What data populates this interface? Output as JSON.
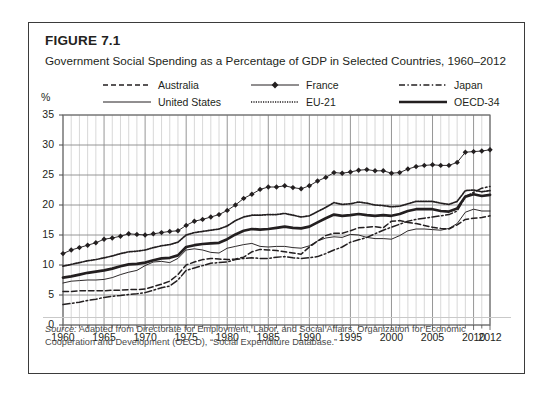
{
  "figure": {
    "label": "FIGURE 7.1",
    "title": "Government Social Spending as a Percentage of GDP in Selected Countries, 1960–2012"
  },
  "source": {
    "label": "Source:",
    "text": " Adapted from Directorate for Employment, Labor, and Social Affairs, Organization for Economic Cooperation and Development (OECD), “Social Expenditure Database.”"
  },
  "axis": {
    "y_unit": "%",
    "y_ticks": [
      "0",
      "5",
      "10",
      "15",
      "20",
      "25",
      "30",
      "35"
    ],
    "x_ticks": [
      "1960",
      "1965",
      "1970",
      "1975",
      "1980",
      "1985",
      "1990",
      "1995",
      "2000",
      "2005",
      "2010",
      "2012"
    ]
  },
  "legend": {
    "items": [
      {
        "label": "Australia",
        "style": "dashed",
        "marker": "none"
      },
      {
        "label": "France",
        "style": "solid-thin",
        "marker": "diamond"
      },
      {
        "label": "Japan",
        "style": "dashdot",
        "marker": "none"
      },
      {
        "label": "United States",
        "style": "solid-thin",
        "marker": "none"
      },
      {
        "label": "EU-21",
        "style": "dotted",
        "marker": "none"
      },
      {
        "label": "OECD-34",
        "style": "solid-thick",
        "marker": "none"
      }
    ]
  },
  "colors": {
    "ink": "#231f20",
    "grid": "#9a9a9a",
    "frame": "#3b3b3b",
    "note": "#4a4a4a"
  },
  "chart_data": {
    "type": "line",
    "title": "Government Social Spending as a Percentage of GDP in Selected Countries, 1960–2012",
    "xlabel": "",
    "ylabel": "%",
    "xlim": [
      1960,
      2012
    ],
    "ylim": [
      0,
      35
    ],
    "yticks": [
      0,
      5,
      10,
      15,
      20,
      25,
      30,
      35
    ],
    "xticks": [
      1960,
      1965,
      1970,
      1975,
      1980,
      1985,
      1990,
      1995,
      2000,
      2005,
      2010,
      2012
    ],
    "grid": "vertical-major-and-minor-plus-horizontal",
    "legend_position": "above-plot",
    "x": [
      1960,
      1961,
      1962,
      1963,
      1964,
      1965,
      1966,
      1967,
      1968,
      1969,
      1970,
      1971,
      1972,
      1973,
      1974,
      1975,
      1976,
      1977,
      1978,
      1979,
      1980,
      1981,
      1982,
      1983,
      1984,
      1985,
      1986,
      1987,
      1988,
      1989,
      1990,
      1991,
      1992,
      1993,
      1994,
      1995,
      1996,
      1997,
      1998,
      1999,
      2000,
      2001,
      2002,
      2003,
      2004,
      2005,
      2006,
      2007,
      2008,
      2009,
      2010,
      2011,
      2012
    ],
    "series": [
      {
        "name": "France",
        "style": "solid-thin",
        "marker": "diamond",
        "values": [
          11.9,
          12.5,
          12.9,
          13.3,
          13.7,
          14.3,
          14.5,
          14.8,
          15.2,
          15.1,
          15.0,
          15.2,
          15.4,
          15.6,
          15.7,
          16.6,
          17.3,
          17.6,
          18.0,
          18.4,
          19.1,
          20.0,
          21.1,
          21.8,
          22.6,
          23.0,
          23.0,
          23.2,
          22.9,
          22.7,
          23.2,
          24.0,
          24.6,
          25.4,
          25.3,
          25.5,
          25.8,
          25.9,
          25.7,
          25.7,
          25.3,
          25.4,
          26.0,
          26.4,
          26.6,
          26.7,
          26.6,
          26.6,
          27.1,
          28.8,
          28.9,
          29.0,
          29.2
        ],
        "units": "% of GDP"
      },
      {
        "name": "EU-21",
        "style": "dotted",
        "values": [
          9.8,
          10.1,
          10.4,
          10.7,
          10.9,
          11.2,
          11.5,
          11.9,
          12.2,
          12.3,
          12.5,
          12.9,
          13.2,
          13.4,
          13.8,
          15.0,
          15.4,
          15.6,
          15.8,
          16.0,
          16.5,
          17.4,
          18.0,
          18.3,
          18.3,
          18.4,
          18.4,
          18.6,
          18.3,
          18.0,
          18.2,
          18.9,
          19.6,
          20.4,
          20.1,
          20.2,
          20.5,
          20.3,
          20.0,
          19.9,
          19.7,
          19.8,
          20.2,
          20.6,
          20.6,
          20.6,
          20.3,
          20.1,
          20.6,
          22.4,
          22.5,
          22.2,
          22.4
        ],
        "units": "% of GDP"
      },
      {
        "name": "OECD-34",
        "style": "solid-thick",
        "values": [
          7.9,
          8.1,
          8.4,
          8.7,
          8.9,
          9.1,
          9.4,
          9.8,
          10.1,
          10.2,
          10.4,
          10.8,
          11.1,
          11.2,
          11.6,
          13.0,
          13.3,
          13.5,
          13.6,
          13.7,
          14.3,
          15.1,
          15.7,
          16.0,
          15.9,
          16.0,
          16.2,
          16.4,
          16.2,
          16.1,
          16.4,
          17.1,
          17.8,
          18.4,
          18.2,
          18.3,
          18.5,
          18.3,
          18.2,
          18.3,
          18.2,
          18.5,
          19.0,
          19.3,
          19.3,
          19.3,
          19.0,
          18.9,
          19.4,
          21.4,
          21.8,
          21.5,
          21.7
        ],
        "units": "% of GDP"
      },
      {
        "name": "United States",
        "style": "solid-thin",
        "values": [
          7.0,
          7.3,
          7.4,
          7.5,
          7.5,
          7.6,
          7.9,
          8.4,
          8.8,
          9.1,
          9.9,
          10.5,
          10.6,
          10.4,
          11.1,
          12.5,
          12.7,
          12.5,
          12.1,
          12.0,
          12.8,
          13.1,
          13.4,
          13.6,
          13.1,
          13.0,
          13.1,
          13.1,
          12.9,
          12.8,
          13.2,
          14.0,
          14.5,
          14.7,
          14.6,
          15.1,
          15.0,
          14.6,
          14.4,
          14.4,
          14.3,
          14.9,
          15.7,
          16.0,
          16.0,
          15.9,
          15.8,
          16.1,
          16.9,
          18.8,
          19.3,
          19.0,
          19.0
        ],
        "units": "% of GDP"
      },
      {
        "name": "Australia",
        "style": "dashed",
        "values": [
          5.6,
          5.6,
          5.7,
          5.7,
          5.7,
          5.7,
          5.8,
          5.8,
          5.9,
          5.9,
          6.0,
          6.4,
          6.8,
          7.3,
          8.4,
          10.0,
          10.5,
          10.9,
          11.1,
          11.0,
          10.9,
          11.0,
          11.3,
          12.2,
          12.6,
          12.5,
          12.4,
          12.2,
          12.0,
          11.8,
          13.0,
          14.0,
          14.9,
          15.3,
          15.3,
          15.7,
          16.2,
          16.3,
          16.4,
          16.2,
          17.3,
          17.4,
          17.1,
          16.9,
          16.6,
          16.3,
          16.1,
          16.0,
          16.7,
          17.6,
          17.8,
          17.9,
          18.2
        ],
        "units": "% of GDP"
      },
      {
        "name": "Japan",
        "style": "dashdot",
        "values": [
          3.4,
          3.6,
          3.8,
          4.1,
          4.3,
          4.6,
          4.8,
          4.9,
          5.1,
          5.2,
          5.4,
          5.8,
          6.2,
          6.5,
          7.5,
          9.1,
          9.5,
          9.9,
          10.3,
          10.4,
          10.5,
          10.9,
          11.1,
          11.2,
          11.1,
          11.1,
          11.3,
          11.4,
          11.2,
          11.1,
          11.2,
          11.4,
          11.9,
          12.5,
          13.0,
          13.8,
          14.2,
          14.6,
          15.2,
          15.8,
          16.3,
          16.8,
          17.3,
          17.6,
          17.8,
          18.0,
          18.2,
          18.4,
          19.0,
          21.4,
          22.1,
          22.8,
          23.1
        ],
        "units": "% of GDP"
      }
    ]
  }
}
